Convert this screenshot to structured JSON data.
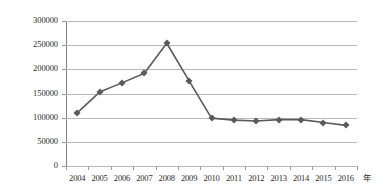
{
  "chart_data": {
    "type": "line",
    "title": "",
    "xlabel": "年",
    "ylabel": "",
    "categories": [
      "2004",
      "2005",
      "2006",
      "2007",
      "2008",
      "2009",
      "2010",
      "2011",
      "2012",
      "2013",
      "2014",
      "2015",
      "2016"
    ],
    "values": [
      110000,
      153000,
      172000,
      192000,
      254000,
      176000,
      99000,
      95000,
      93000,
      96000,
      96000,
      90000,
      84000
    ],
    "series": [
      {
        "name": "",
        "values": [
          110000,
          153000,
          172000,
          192000,
          254000,
          176000,
          99000,
          95000,
          93000,
          96000,
          96000,
          90000,
          84000
        ]
      }
    ],
    "ylim": [
      0,
      300000
    ],
    "yticks": [
      0,
      50000,
      100000,
      150000,
      200000,
      250000,
      300000
    ],
    "ytick_labels": [
      "0",
      "50000",
      "100000",
      "150000",
      "200000",
      "250000",
      "300000"
    ],
    "grid": true,
    "legend": "none",
    "marker": "diamond",
    "line_color": "#5a5a5a",
    "marker_color": "#5a5a5a",
    "grid_color": "#b9b9b9",
    "axis_color": "#7f7f7f",
    "text_color": "#2b2b2b",
    "background": "#ffffff"
  }
}
